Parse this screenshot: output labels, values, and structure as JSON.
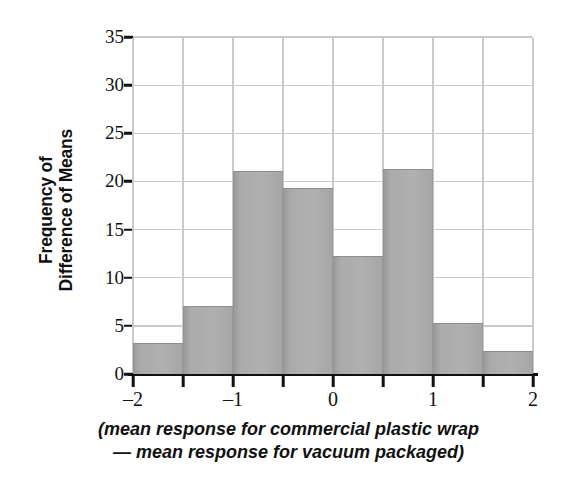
{
  "chart_data": {
    "type": "bar",
    "title": "",
    "subtitle": "",
    "xlabel_lines": [
      "(mean response for commercial plastic wrap",
      "— mean response for vacuum packaged)"
    ],
    "ylabel_lines": [
      "Frequency of",
      "Difference of Means"
    ],
    "categories": [
      "-2 to -1.5",
      "-1.5 to -1",
      "-1 to -0.5",
      "-0.5 to 0",
      "0 to 0.5",
      "0.5 to 1",
      "1 to 1.5",
      "1.5 to 2"
    ],
    "bin_edges": [
      -2,
      -1.5,
      -1,
      -0.5,
      0,
      0.5,
      1,
      1.5,
      2
    ],
    "values": [
      3.2,
      7.1,
      21.1,
      19.3,
      12.3,
      21.3,
      5.3,
      2.4
    ],
    "xlim": [
      -2,
      2
    ],
    "ylim": [
      0,
      35
    ],
    "xticks": [
      -2,
      -1.5,
      -1,
      -0.5,
      0,
      0.5,
      1,
      1.5,
      2
    ],
    "xtick_labels": [
      "–2",
      "",
      "–1",
      "",
      "0",
      "",
      "1",
      "",
      "2"
    ],
    "yticks": [
      0,
      5,
      10,
      15,
      20,
      25,
      30,
      35
    ],
    "ytick_labels": [
      "0",
      "5",
      "10",
      "15",
      "20",
      "25",
      "30",
      "35"
    ],
    "grid": true,
    "grid_color": "#c9c9c9",
    "bar_color": "#ababab",
    "bar_edge_color": "#8e8e8e",
    "axis_color": "#111111",
    "background": "#ffffff",
    "legend": null
  }
}
